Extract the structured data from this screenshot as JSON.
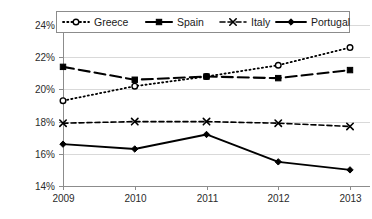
{
  "chart_data": {
    "type": "line",
    "title": "",
    "xlabel": "",
    "ylabel": "",
    "x": [
      "2009",
      "2010",
      "2011",
      "2012",
      "2013"
    ],
    "categories": [
      "2009",
      "2010",
      "2011",
      "2012",
      "2013"
    ],
    "ylim": [
      14,
      24
    ],
    "yticks": [
      14,
      16,
      18,
      20,
      22,
      24
    ],
    "ytick_labels": [
      "14%",
      "16%",
      "18%",
      "20%",
      "22%",
      "24%"
    ],
    "grid": true,
    "legend_position": "top",
    "value_suffix": "%",
    "series": [
      {
        "name": "Greece",
        "values": [
          19.3,
          20.2,
          20.8,
          21.5,
          22.6
        ],
        "line_style": "dotted",
        "marker": "circle-open",
        "color": "#000000"
      },
      {
        "name": "Spain",
        "values": [
          21.4,
          20.6,
          20.8,
          20.7,
          21.2
        ],
        "line_style": "long-dash",
        "marker": "square-filled",
        "color": "#000000"
      },
      {
        "name": "Italy",
        "values": [
          17.9,
          18.0,
          18.0,
          17.9,
          17.7
        ],
        "line_style": "dashed",
        "marker": "x",
        "color": "#000000"
      },
      {
        "name": "Portugal",
        "values": [
          16.6,
          16.3,
          17.2,
          15.5,
          15.0
        ],
        "line_style": "solid",
        "marker": "diamond-filled",
        "color": "#000000"
      }
    ]
  },
  "legend": {
    "items": [
      {
        "label": "Greece"
      },
      {
        "label": "Spain"
      },
      {
        "label": "Italy"
      },
      {
        "label": "Portugal"
      }
    ]
  },
  "axes": {
    "y_labels": [
      "24%",
      "22%",
      "20%",
      "18%",
      "16%",
      "14%"
    ],
    "x_labels": [
      "2009",
      "2010",
      "2011",
      "2012",
      "2013"
    ]
  }
}
